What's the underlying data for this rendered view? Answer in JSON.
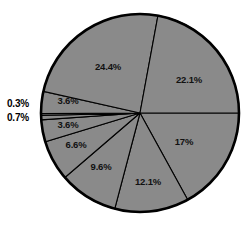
{
  "chart_data": {
    "type": "pie",
    "title": "",
    "subtitle": "",
    "xlabel": "",
    "ylabel": "",
    "legend": "none",
    "grid": false,
    "start_angle_deg": 0,
    "direction": "clockwise",
    "fill_color": "#8a8a8a",
    "stroke_color": "#000000",
    "background_color": "#ffffff",
    "label_color": "#111111",
    "categories": [
      "17%",
      "12.1%",
      "9.6%",
      "6.6%",
      "3.6%",
      "0.7%",
      "0.3%",
      "3.6%",
      "24.4%",
      "22.1%"
    ],
    "values": [
      17.0,
      12.1,
      9.6,
      6.6,
      3.6,
      0.7,
      0.3,
      3.6,
      24.4,
      22.1
    ],
    "slices": [
      {
        "label": "17%",
        "value": 17.0,
        "label_x": 184,
        "label_y": 142,
        "label_placement": "inside"
      },
      {
        "label": "12.1%",
        "value": 12.1,
        "label_x": 148,
        "label_y": 182,
        "label_placement": "inside"
      },
      {
        "label": "9.6%",
        "value": 9.6,
        "label_x": 101,
        "label_y": 167,
        "label_placement": "inside"
      },
      {
        "label": "6.6%",
        "value": 6.6,
        "label_x": 76,
        "label_y": 145,
        "label_placement": "inside"
      },
      {
        "label": "3.6%",
        "value": 3.6,
        "label_x": 68,
        "label_y": 125,
        "label_placement": "inside"
      },
      {
        "label": "0.7%",
        "value": 0.7,
        "label_x": 18,
        "label_y": 118,
        "label_placement": "outside"
      },
      {
        "label": "0.3%",
        "value": 0.3,
        "label_x": 18,
        "label_y": 104,
        "label_placement": "outside"
      },
      {
        "label": "3.6%",
        "value": 3.6,
        "label_x": 68,
        "label_y": 101,
        "label_placement": "inside"
      },
      {
        "label": "24.4%",
        "value": 24.4,
        "label_x": 108,
        "label_y": 67,
        "label_placement": "inside"
      },
      {
        "label": "22.1%",
        "value": 22.1,
        "label_x": 189,
        "label_y": 80,
        "label_placement": "inside"
      }
    ],
    "total": 99.8,
    "geometry": {
      "cx": 140,
      "cy": 113,
      "r": 99
    }
  }
}
